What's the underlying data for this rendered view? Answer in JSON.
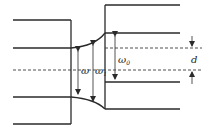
{
  "diagram": {
    "labels": {
      "omega": "ω",
      "omega1_base": "ω",
      "omega1_sub": "1",
      "omega0_base": "ω",
      "omega0_sub": "0",
      "d": "d"
    },
    "colors": {
      "line": "#2a2a2a",
      "background": "#ffffff"
    }
  }
}
